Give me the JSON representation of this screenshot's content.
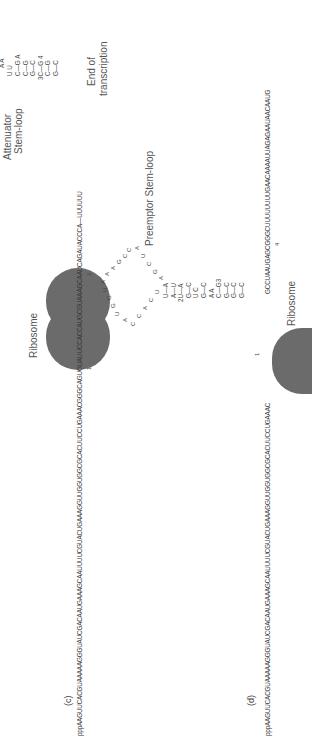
{
  "panel_c": {
    "label": "(c)",
    "sequence": "pppAAGUUCACGUAAAAAGGGUAUCGACAAUGAAAGCAAUUUUCGUACUGAAAGGUUGGUGGCGCACUUCCUGAAACGGGCAGUGUAUUCCACCAUGCGUAAAGCAAUCAGAUACCCA—UUUUUU",
    "ribosome_label": "Ribosome",
    "marker_1": "1",
    "marker_2": "2",
    "attenuator_label_line1": "Attenuator",
    "attenuator_label_line2": "Stem-loop",
    "attenuator_stem": {
      "loop_top": "A  A",
      "loop_mid": "U      U",
      "pairs": [
        "C—G A",
        "C—G",
        "G—C",
        "3C—G 4",
        "C—G",
        "G—C"
      ]
    },
    "end_label_line1": "End of",
    "end_label_line2": "transcription"
  },
  "panel_d": {
    "label": "(d)",
    "sequence_left": "pppAAGUUCACGUAAAAAGGGUAUCGACAAUGAAAGCAAUUUUCGUACUGAAAGGUUGGUGGCGCACUUCCUGAAAC",
    "sequence_right": "GCCUAAUGAGCGGGCUUUUUUUUGAACAAAAUUAGAGAAUAACAAUG",
    "ribosome_label": "Ribosome",
    "marker_1": "1",
    "marker_4": "4",
    "preemptor_label": "Preemptor Stem-loop",
    "preemptor_loop_left": [
      "A",
      "C",
      "C",
      "A",
      "C",
      "U"
    ],
    "preemptor_loop_top": [
      "U",
      "G",
      "G",
      "U",
      "A",
      "A",
      "A",
      "G",
      "C",
      "C"
    ],
    "preemptor_loop_right": [
      "A",
      "U",
      "C",
      "G",
      "A"
    ],
    "preemptor_stem": [
      "U—A",
      "A—U",
      "2U—A",
      "G—C",
      "U      C",
      "G—C",
      "A      A",
      "C—G3",
      "G—C",
      "G—C",
      "G—C"
    ]
  }
}
